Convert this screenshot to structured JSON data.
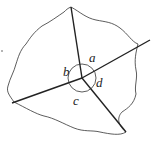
{
  "diagram": {
    "angle_labels": {
      "a": "a",
      "b": "b",
      "c": "c",
      "d": "d"
    },
    "colors": {
      "line": "#222222",
      "boundary": "#333333",
      "background": "#ffffff"
    }
  }
}
